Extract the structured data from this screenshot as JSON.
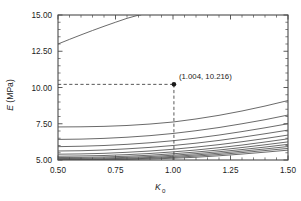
{
  "figure": {
    "name": "E-vs-K0-curve-family-plot",
    "background_color": "#ffffff",
    "axis_color": "#4a4a4a",
    "curve_color": "#4f4f4f",
    "marker_color": "#1a1a1a"
  },
  "chart_data": {
    "type": "line",
    "title": "",
    "subtitle": "",
    "xlabel": "K0",
    "xlabel_base": "K",
    "xlabel_sub": "0",
    "ylabel": "E (MPa)",
    "ylabel_italic_part": "E",
    "ylabel_rest": " (MPa)",
    "xlim": [
      0.5,
      1.5
    ],
    "ylim": [
      5.0,
      15.0
    ],
    "xticks": [
      0.5,
      0.75,
      1.0,
      1.25,
      1.5
    ],
    "xticklabels": [
      "0.50",
      "0.75",
      "1.00",
      "1.25",
      "1.50"
    ],
    "yticks": [
      5.0,
      7.5,
      10.0,
      12.5,
      15.0
    ],
    "yticklabels": [
      "5.00",
      "7.50",
      "10.00",
      "12.50",
      "15.00"
    ],
    "x_minor_count": 4,
    "y_minor_count": 4,
    "grid": false,
    "legend": null,
    "legend_position": "none",
    "annotations": [
      {
        "label": "(1.004, 10.216)",
        "x": 1.004,
        "y": 10.216,
        "marker": "filled-circle",
        "guides": [
          "horizontal-to-y-axis",
          "vertical-to-x-axis"
        ]
      }
    ],
    "series": [
      {
        "name": "curve-1",
        "x": [
          0.5,
          0.55,
          0.6,
          0.65,
          0.7,
          0.75,
          0.8,
          0.85,
          0.86
        ],
        "values": [
          13.0,
          13.32,
          13.63,
          13.93,
          14.22,
          14.5,
          14.77,
          14.99,
          15.0
        ]
      },
      {
        "name": "curve-2",
        "x": [
          0.5,
          0.6,
          0.7,
          0.8,
          0.9,
          1.0,
          1.1,
          1.2,
          1.3,
          1.4,
          1.5
        ],
        "values": [
          7.28,
          7.29,
          7.32,
          7.38,
          7.48,
          7.62,
          7.83,
          8.08,
          8.38,
          8.72,
          9.1
        ]
      },
      {
        "name": "curve-3",
        "x": [
          0.5,
          0.6,
          0.7,
          0.8,
          0.9,
          1.0,
          1.1,
          1.2,
          1.3,
          1.4,
          1.5
        ],
        "values": [
          6.42,
          6.44,
          6.49,
          6.57,
          6.68,
          6.83,
          7.02,
          7.24,
          7.5,
          7.78,
          8.1
        ]
      },
      {
        "name": "curve-4",
        "x": [
          0.5,
          0.6,
          0.7,
          0.8,
          0.9,
          1.0,
          1.1,
          1.2,
          1.3,
          1.4,
          1.5
        ],
        "values": [
          5.92,
          5.95,
          6.0,
          6.08,
          6.19,
          6.33,
          6.51,
          6.72,
          6.96,
          7.22,
          7.5
        ]
      },
      {
        "name": "curve-5",
        "x": [
          0.5,
          0.6,
          0.7,
          0.8,
          0.9,
          1.0,
          1.1,
          1.2,
          1.3,
          1.4,
          1.5
        ],
        "values": [
          5.62,
          5.64,
          5.69,
          5.77,
          5.87,
          6.0,
          6.16,
          6.35,
          6.57,
          6.81,
          7.06
        ]
      },
      {
        "name": "curve-6",
        "x": [
          0.5,
          0.6,
          0.7,
          0.8,
          0.9,
          1.0,
          1.1,
          1.2,
          1.3,
          1.4,
          1.5
        ],
        "values": [
          5.4,
          5.42,
          5.46,
          5.53,
          5.62,
          5.74,
          5.89,
          6.06,
          6.26,
          6.48,
          6.72
        ]
      },
      {
        "name": "curve-7",
        "x": [
          0.5,
          0.6,
          0.7,
          0.8,
          0.9,
          1.0,
          1.1,
          1.2,
          1.3,
          1.4,
          1.5
        ],
        "values": [
          5.26,
          5.28,
          5.31,
          5.37,
          5.45,
          5.56,
          5.69,
          5.85,
          6.03,
          6.24,
          6.46
        ]
      },
      {
        "name": "curve-8",
        "x": [
          0.5,
          0.6,
          0.7,
          0.8,
          0.9,
          1.0,
          1.1,
          1.2,
          1.3,
          1.4,
          1.5
        ],
        "values": [
          5.17,
          5.18,
          5.21,
          5.26,
          5.33,
          5.43,
          5.55,
          5.69,
          5.86,
          6.05,
          6.25
        ]
      },
      {
        "name": "curve-9",
        "x": [
          0.5,
          0.6,
          0.7,
          0.8,
          0.9,
          1.0,
          1.1,
          1.2,
          1.3,
          1.4,
          1.5
        ],
        "values": [
          5.1,
          5.11,
          5.14,
          5.18,
          5.24,
          5.33,
          5.44,
          5.57,
          5.72,
          5.89,
          6.08
        ]
      },
      {
        "name": "curve-10",
        "x": [
          0.5,
          0.6,
          0.7,
          0.8,
          0.9,
          1.0,
          1.1,
          1.2,
          1.3,
          1.4,
          1.5
        ],
        "values": [
          5.05,
          5.06,
          5.08,
          5.12,
          5.17,
          5.25,
          5.35,
          5.47,
          5.61,
          5.76,
          5.93
        ]
      },
      {
        "name": "curve-11",
        "x": [
          0.5,
          0.6,
          0.7,
          0.8,
          0.9,
          1.0,
          1.1,
          1.2,
          1.3,
          1.4,
          1.5
        ],
        "values": [
          5.02,
          5.03,
          5.04,
          5.07,
          5.12,
          5.18,
          5.27,
          5.38,
          5.51,
          5.65,
          5.8
        ]
      },
      {
        "name": "curve-12",
        "x": [
          0.5,
          0.6,
          0.7,
          0.8,
          0.9,
          1.0,
          1.1,
          1.2,
          1.3,
          1.4,
          1.5
        ],
        "values": [
          5.0,
          5.01,
          5.02,
          5.04,
          5.07,
          5.12,
          5.19,
          5.29,
          5.41,
          5.54,
          5.68
        ]
      }
    ]
  }
}
